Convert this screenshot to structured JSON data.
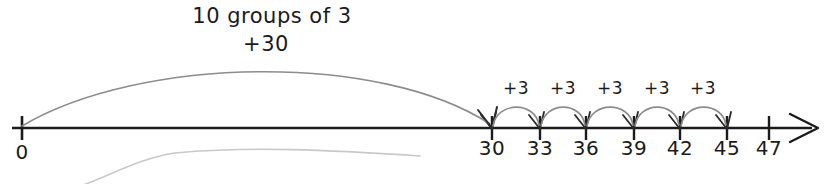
{
  "canvas": {
    "width": 827,
    "height": 184,
    "background": "#ffffff",
    "line_color": "#1b1b1b",
    "arc_color": "#8c8c8c",
    "faint_arc_color": "#c8c8c8",
    "text_color": "#1b1b1b"
  },
  "big_jump": {
    "title": "10 groups of 3",
    "value_label": "+30",
    "title_x": 272,
    "value_x": 266,
    "from_x": 22,
    "to_x": 492,
    "apex_y": 68
  },
  "number_line": {
    "axis_y": 128,
    "start_x": 12,
    "end_x": 820,
    "origin": {
      "label": "0",
      "x": 22
    },
    "ticks": [
      {
        "label": "30",
        "x": 492,
        "arrow": true
      },
      {
        "label": "33",
        "x": 540,
        "arrow": true
      },
      {
        "label": "36",
        "x": 586,
        "arrow": true
      },
      {
        "label": "39",
        "x": 634,
        "arrow": true
      },
      {
        "label": "42",
        "x": 680,
        "arrow": true
      },
      {
        "label": "45",
        "x": 727,
        "arrow": true
      },
      {
        "label": "47",
        "x": 769,
        "arrow": false
      }
    ]
  },
  "small_jumps": [
    {
      "label": "+3",
      "from_x": 492,
      "to_x": 540,
      "label_x": 516,
      "apex_y": 101
    },
    {
      "label": "+3",
      "from_x": 540,
      "to_x": 586,
      "label_x": 563,
      "apex_y": 101
    },
    {
      "label": "+3",
      "from_x": 586,
      "to_x": 634,
      "label_x": 610,
      "apex_y": 101
    },
    {
      "label": "+3",
      "from_x": 634,
      "to_x": 680,
      "label_x": 657,
      "apex_y": 101
    },
    {
      "label": "+3",
      "from_x": 680,
      "to_x": 727,
      "label_x": 703,
      "apex_y": 101
    }
  ],
  "chart_data": {
    "type": "line",
    "title": "10 groups of 3",
    "xlabel": "",
    "ylabel": "",
    "xlim": [
      0,
      47
    ],
    "categories": [
      "0",
      "30",
      "33",
      "36",
      "39",
      "42",
      "45",
      "47"
    ],
    "values": [
      0,
      30,
      33,
      36,
      39,
      42,
      45,
      47
    ],
    "tick_labels": [
      "0",
      "30",
      "33",
      "36",
      "39",
      "42",
      "45",
      "47"
    ],
    "annotations": [
      "10 groups of 3",
      "+30",
      "+3",
      "+3",
      "+3",
      "+3",
      "+3"
    ],
    "jumps": [
      {
        "from": 0,
        "to": 30,
        "label": "+30",
        "note": "10 groups of 3"
      },
      {
        "from": 30,
        "to": 33,
        "label": "+3"
      },
      {
        "from": 33,
        "to": 36,
        "label": "+3"
      },
      {
        "from": 36,
        "to": 39,
        "label": "+3"
      },
      {
        "from": 39,
        "to": 42,
        "label": "+3"
      },
      {
        "from": 42,
        "to": 45,
        "label": "+3"
      }
    ],
    "grid": false,
    "legend": "none"
  }
}
